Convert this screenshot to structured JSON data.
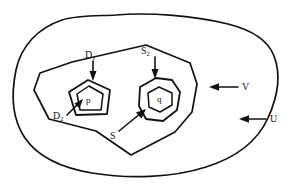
{
  "figure": {
    "type": "nested-regions-topology-diagram",
    "background_color": "#ffffff",
    "stroke_color": "#111111",
    "width": 294,
    "height": 189
  },
  "regions": [
    {
      "id": "U",
      "label": "U",
      "shape": "blob",
      "description": "outermost smooth closed curve"
    },
    {
      "id": "V",
      "label": "V",
      "shape": "polygon",
      "description": "large irregular polygon inside U"
    },
    {
      "id": "D1",
      "label": "D",
      "subscript": "1",
      "shape": "pentagon",
      "description": "outer pentagon of the left nested pair"
    },
    {
      "id": "D2",
      "label": "D",
      "subscript": "2",
      "shape": "pentagon",
      "description": "inner pentagon of the left nested pair, contains point p"
    },
    {
      "id": "S2",
      "label": "S",
      "subscript": "2",
      "shape": "heptagon",
      "description": "outer heptagon of the right nested pair"
    },
    {
      "id": "S",
      "label": "S",
      "subscript": "",
      "shape": "hexagon",
      "description": "inner hexagon of the right nested pair, contains point q"
    }
  ],
  "points": [
    {
      "id": "p",
      "label": "p",
      "inside": "D2"
    },
    {
      "id": "q",
      "label": "q",
      "inside": "S"
    }
  ],
  "annotations": [
    {
      "id": "label-D1",
      "text": "D",
      "sub": "1",
      "x": 86,
      "y": 52,
      "arrow": "down"
    },
    {
      "id": "label-D2",
      "text": "D",
      "sub": "2",
      "x": 54,
      "y": 112,
      "arrow": "up-right"
    },
    {
      "id": "label-S2",
      "text": "S",
      "sub": "2",
      "x": 142,
      "y": 48,
      "arrow": "down"
    },
    {
      "id": "label-S",
      "text": "S",
      "sub": "",
      "x": 117,
      "y": 133,
      "arrow": "up-right"
    },
    {
      "id": "label-V",
      "text": "V",
      "sub": "",
      "x": 243,
      "y": 85,
      "arrow": "left"
    },
    {
      "id": "label-U",
      "text": "U",
      "sub": "",
      "x": 271,
      "y": 118,
      "arrow": "left"
    }
  ]
}
